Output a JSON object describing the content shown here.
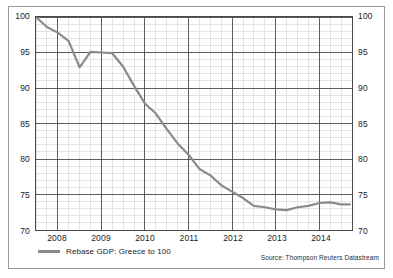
{
  "figure": {
    "source_note": "Source: Thompson Reuters Datastream",
    "frame_color": "#9a9a9a",
    "background": "#ffffff"
  },
  "legend": {
    "position": "bottom-left",
    "entries": [
      {
        "label": "Rebase GDP: Greece to 100",
        "color": "#8a8a8a"
      }
    ]
  },
  "axes": {
    "y_left_ticks": [
      "100",
      "95",
      "90",
      "85",
      "80",
      "75",
      "70"
    ],
    "y_right_ticks": [
      "100",
      "95",
      "90",
      "85",
      "80",
      "75",
      "70"
    ],
    "x_ticks": [
      "2008",
      "2009",
      "2010",
      "2011",
      "2012",
      "2013",
      "2014"
    ]
  },
  "chart_data": {
    "type": "line",
    "title": "",
    "subtitle": "",
    "xlabel": "",
    "ylabel": "",
    "xlim": [
      2007.5,
      2014.75
    ],
    "ylim": [
      70,
      100
    ],
    "ytick_step": 5,
    "xtick_step": 1,
    "grid": true,
    "minor_grid": true,
    "legend_position": "bottom-left",
    "annotations": [
      "Source: Thompson Reuters Datastream"
    ],
    "line_color": "#8a8a8a",
    "line_width": 2.2,
    "series": [
      {
        "name": "Rebase GDP: Greece to 100",
        "x": [
          2007.5,
          2007.75,
          2008.0,
          2008.25,
          2008.5,
          2008.75,
          2009.0,
          2009.25,
          2009.5,
          2009.75,
          2010.0,
          2010.25,
          2010.5,
          2010.75,
          2011.0,
          2011.25,
          2011.5,
          2011.75,
          2012.0,
          2012.25,
          2012.5,
          2012.75,
          2013.0,
          2013.25,
          2013.5,
          2013.75,
          2014.0,
          2014.25,
          2014.5,
          2014.7
        ],
        "values": [
          100.0,
          98.6,
          97.8,
          96.6,
          92.9,
          95.1,
          95.0,
          94.9,
          93.0,
          90.3,
          87.8,
          86.4,
          84.2,
          82.2,
          80.6,
          78.6,
          77.7,
          76.3,
          75.4,
          74.5,
          73.4,
          73.2,
          72.9,
          72.8,
          73.2,
          73.4,
          73.8,
          73.9,
          73.6,
          73.6
        ]
      }
    ]
  }
}
